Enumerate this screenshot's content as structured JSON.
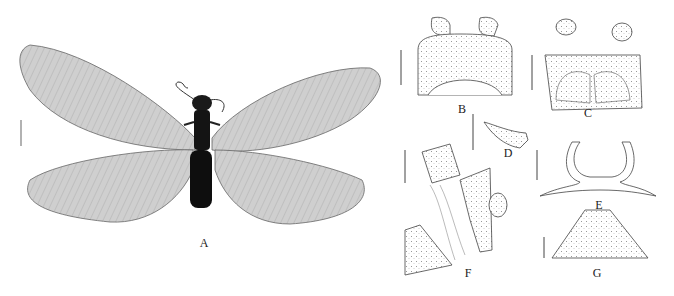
{
  "figure": {
    "panels": [
      {
        "id": "A",
        "label": "A",
        "subject": "adult insect habitus, dorsal view"
      },
      {
        "id": "B",
        "label": "B",
        "subject": "head and pronotum, dorsal view"
      },
      {
        "id": "C",
        "label": "C",
        "subject": "head and pronotum, ventral view"
      },
      {
        "id": "D",
        "label": "D",
        "subject": "mandible"
      },
      {
        "id": "E",
        "label": "E",
        "subject": "sclerite outline"
      },
      {
        "id": "F",
        "label": "F",
        "subject": "male terminalia, lateral view"
      },
      {
        "id": "G",
        "label": "G",
        "subject": "subgenital plate"
      }
    ],
    "scale_bars": [
      "A",
      "B",
      "C",
      "D",
      "E",
      "F",
      "G"
    ],
    "colors": {
      "background": "#ffffff",
      "wing": "#c8c8c8",
      "body": "#111111",
      "line": "#444444"
    }
  }
}
